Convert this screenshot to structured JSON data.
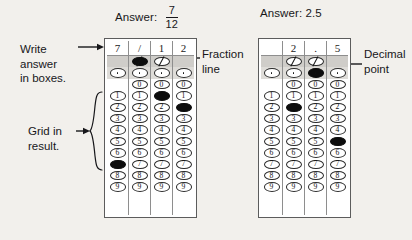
{
  "page": {
    "background": "#f2f0ec",
    "ink": "#17171a"
  },
  "headings": {
    "left": {
      "label": "Answer:",
      "value_type": "fraction",
      "numerator": "7",
      "denominator": "12"
    },
    "right": {
      "label": "Answer: 2.5",
      "value_type": "decimal",
      "value": "2.5"
    }
  },
  "annotations": {
    "write_in_boxes": "Write\nanswer\nin boxes.",
    "grid_in_result": "Grid in\nresult.",
    "fraction_line": "Fraction\nline",
    "decimal_point": "Decimal\npoint"
  },
  "grids": [
    {
      "id": "grid-left",
      "name": "fraction-answer-grid",
      "columns": 4,
      "write_row": [
        "7",
        "/",
        "1",
        "2"
      ],
      "special_rows": [
        {
          "symbol": "/",
          "name": "fraction-line-row",
          "cells": [
            {
              "present": false,
              "filled": false
            },
            {
              "present": true,
              "filled": true
            },
            {
              "present": true,
              "filled": false
            },
            {
              "present": false,
              "filled": false
            }
          ]
        },
        {
          "symbol": ".",
          "name": "decimal-point-row",
          "cells": [
            {
              "present": true,
              "filled": false
            },
            {
              "present": true,
              "filled": false
            },
            {
              "present": true,
              "filled": false
            },
            {
              "present": true,
              "filled": false
            }
          ]
        }
      ],
      "digit_rows": [
        {
          "digit": "0",
          "cells": [
            {
              "present": false,
              "filled": false
            },
            {
              "present": true,
              "filled": false
            },
            {
              "present": true,
              "filled": false
            },
            {
              "present": true,
              "filled": false
            }
          ]
        },
        {
          "digit": "1",
          "cells": [
            {
              "present": true,
              "filled": false
            },
            {
              "present": true,
              "filled": false
            },
            {
              "present": true,
              "filled": true
            },
            {
              "present": true,
              "filled": false
            }
          ]
        },
        {
          "digit": "2",
          "cells": [
            {
              "present": true,
              "filled": false
            },
            {
              "present": true,
              "filled": false
            },
            {
              "present": true,
              "filled": false
            },
            {
              "present": true,
              "filled": true
            }
          ]
        },
        {
          "digit": "3",
          "cells": [
            {
              "present": true,
              "filled": false
            },
            {
              "present": true,
              "filled": false
            },
            {
              "present": true,
              "filled": false
            },
            {
              "present": true,
              "filled": false
            }
          ]
        },
        {
          "digit": "4",
          "cells": [
            {
              "present": true,
              "filled": false
            },
            {
              "present": true,
              "filled": false
            },
            {
              "present": true,
              "filled": false
            },
            {
              "present": true,
              "filled": false
            }
          ]
        },
        {
          "digit": "5",
          "cells": [
            {
              "present": true,
              "filled": false
            },
            {
              "present": true,
              "filled": false
            },
            {
              "present": true,
              "filled": false
            },
            {
              "present": true,
              "filled": false
            }
          ]
        },
        {
          "digit": "6",
          "cells": [
            {
              "present": true,
              "filled": false
            },
            {
              "present": true,
              "filled": false
            },
            {
              "present": true,
              "filled": false
            },
            {
              "present": true,
              "filled": false
            }
          ]
        },
        {
          "digit": "7",
          "cells": [
            {
              "present": true,
              "filled": true
            },
            {
              "present": true,
              "filled": false
            },
            {
              "present": true,
              "filled": false
            },
            {
              "present": true,
              "filled": false
            }
          ]
        },
        {
          "digit": "8",
          "cells": [
            {
              "present": true,
              "filled": false
            },
            {
              "present": true,
              "filled": false
            },
            {
              "present": true,
              "filled": false
            },
            {
              "present": true,
              "filled": false
            }
          ]
        },
        {
          "digit": "9",
          "cells": [
            {
              "present": true,
              "filled": false
            },
            {
              "present": true,
              "filled": false
            },
            {
              "present": true,
              "filled": false
            },
            {
              "present": true,
              "filled": false
            }
          ]
        }
      ]
    },
    {
      "id": "grid-right",
      "name": "decimal-answer-grid",
      "columns": 4,
      "write_row": [
        "",
        "2",
        ".",
        "5"
      ],
      "special_rows": [
        {
          "symbol": "/",
          "name": "fraction-line-row",
          "cells": [
            {
              "present": false,
              "filled": false
            },
            {
              "present": true,
              "filled": false
            },
            {
              "present": true,
              "filled": false
            },
            {
              "present": false,
              "filled": false
            }
          ]
        },
        {
          "symbol": ".",
          "name": "decimal-point-row",
          "cells": [
            {
              "present": true,
              "filled": false
            },
            {
              "present": true,
              "filled": false
            },
            {
              "present": true,
              "filled": true
            },
            {
              "present": true,
              "filled": false
            }
          ]
        }
      ],
      "digit_rows": [
        {
          "digit": "0",
          "cells": [
            {
              "present": false,
              "filled": false
            },
            {
              "present": true,
              "filled": false
            },
            {
              "present": true,
              "filled": false
            },
            {
              "present": true,
              "filled": false
            }
          ]
        },
        {
          "digit": "1",
          "cells": [
            {
              "present": true,
              "filled": false
            },
            {
              "present": true,
              "filled": false
            },
            {
              "present": true,
              "filled": false
            },
            {
              "present": true,
              "filled": false
            }
          ]
        },
        {
          "digit": "2",
          "cells": [
            {
              "present": true,
              "filled": false
            },
            {
              "present": true,
              "filled": true
            },
            {
              "present": true,
              "filled": false
            },
            {
              "present": true,
              "filled": false
            }
          ]
        },
        {
          "digit": "3",
          "cells": [
            {
              "present": true,
              "filled": false
            },
            {
              "present": true,
              "filled": false
            },
            {
              "present": true,
              "filled": false
            },
            {
              "present": true,
              "filled": false
            }
          ]
        },
        {
          "digit": "4",
          "cells": [
            {
              "present": true,
              "filled": false
            },
            {
              "present": true,
              "filled": false
            },
            {
              "present": true,
              "filled": false
            },
            {
              "present": true,
              "filled": false
            }
          ]
        },
        {
          "digit": "5",
          "cells": [
            {
              "present": true,
              "filled": false
            },
            {
              "present": true,
              "filled": false
            },
            {
              "present": true,
              "filled": false
            },
            {
              "present": true,
              "filled": true
            }
          ]
        },
        {
          "digit": "6",
          "cells": [
            {
              "present": true,
              "filled": false
            },
            {
              "present": true,
              "filled": false
            },
            {
              "present": true,
              "filled": false
            },
            {
              "present": true,
              "filled": false
            }
          ]
        },
        {
          "digit": "7",
          "cells": [
            {
              "present": true,
              "filled": false
            },
            {
              "present": true,
              "filled": false
            },
            {
              "present": true,
              "filled": false
            },
            {
              "present": true,
              "filled": false
            }
          ]
        },
        {
          "digit": "8",
          "cells": [
            {
              "present": true,
              "filled": false
            },
            {
              "present": true,
              "filled": false
            },
            {
              "present": true,
              "filled": false
            },
            {
              "present": true,
              "filled": false
            }
          ]
        },
        {
          "digit": "9",
          "cells": [
            {
              "present": true,
              "filled": false
            },
            {
              "present": true,
              "filled": false
            },
            {
              "present": true,
              "filled": false
            },
            {
              "present": true,
              "filled": false
            }
          ]
        }
      ]
    }
  ]
}
